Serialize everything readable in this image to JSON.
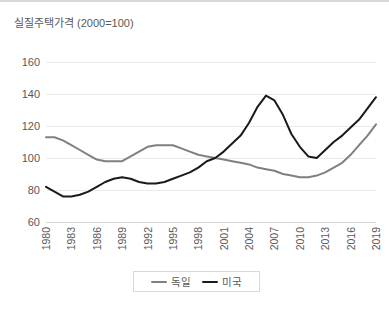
{
  "chart_data": {
    "type": "line",
    "title": "실질주택가격 (2000=100)",
    "xlabel": "",
    "ylabel": "",
    "ylim": [
      60,
      160
    ],
    "yticks": [
      60,
      80,
      100,
      120,
      140,
      160
    ],
    "xlim": [
      1980,
      2019
    ],
    "xticks": [
      1980,
      1983,
      1986,
      1989,
      1992,
      1995,
      1998,
      2001,
      2004,
      2007,
      2010,
      2013,
      2016,
      2019
    ],
    "grid": true,
    "legend_position": "bottom",
    "x": [
      1980,
      1981,
      1982,
      1983,
      1984,
      1985,
      1986,
      1987,
      1988,
      1989,
      1990,
      1991,
      1992,
      1993,
      1994,
      1995,
      1996,
      1997,
      1998,
      1999,
      2000,
      2001,
      2002,
      2003,
      2004,
      2005,
      2006,
      2007,
      2008,
      2009,
      2010,
      2011,
      2012,
      2013,
      2014,
      2015,
      2016,
      2017,
      2018,
      2019
    ],
    "series": [
      {
        "name": "독일",
        "color": "#808080",
        "values": [
          113,
          113,
          111,
          108,
          105,
          102,
          99,
          98,
          98,
          98,
          101,
          104,
          107,
          108,
          108,
          108,
          106,
          104,
          102,
          101,
          100,
          99,
          98,
          97,
          96,
          94,
          93,
          92,
          90,
          89,
          88,
          88,
          89,
          91,
          94,
          97,
          102,
          108,
          114,
          121
        ]
      },
      {
        "name": "미국",
        "color": "#1a1a1a",
        "values": [
          82,
          79,
          76,
          76,
          77,
          79,
          82,
          85,
          87,
          88,
          87,
          85,
          84,
          84,
          85,
          87,
          89,
          91,
          94,
          98,
          100,
          104,
          109,
          114,
          122,
          132,
          139,
          136,
          127,
          115,
          107,
          101,
          100,
          105,
          110,
          114,
          119,
          124,
          131,
          138
        ]
      }
    ]
  },
  "legend": {
    "entries": [
      {
        "label": "독일"
      },
      {
        "label": "미국"
      }
    ]
  }
}
